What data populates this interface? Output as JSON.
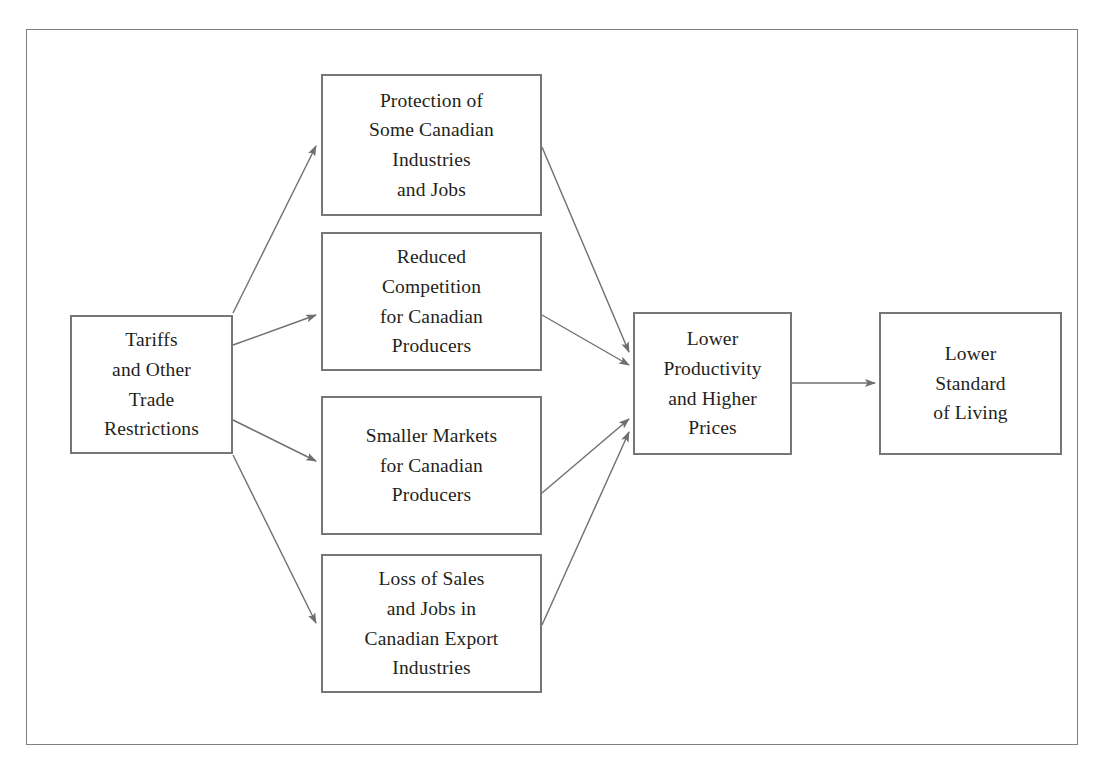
{
  "figure": {
    "frame_color": "#7e7e80",
    "box_border_color": "#76767a",
    "text_color": "#231f20",
    "arrow_color": "#6f6f73",
    "background": "#ffffff"
  },
  "nodes": [
    {
      "id": "tariffs",
      "name": "tariffs-and-other-trade-restrictions",
      "lines": [
        "Tariffs",
        "and Other",
        "Trade",
        "Restrictions"
      ]
    },
    {
      "id": "protection",
      "name": "protection-of-some-canadian-industries-and-jobs",
      "lines": [
        "Protection of",
        "Some Canadian",
        "Industries",
        "and Jobs"
      ]
    },
    {
      "id": "reduced",
      "name": "reduced-competition-for-canadian-producers",
      "lines": [
        "Reduced",
        "Competition",
        "for Canadian",
        "Producers"
      ]
    },
    {
      "id": "smaller",
      "name": "smaller-markets-for-canadian-producers",
      "lines": [
        "Smaller Markets",
        "for Canadian",
        "Producers"
      ]
    },
    {
      "id": "loss",
      "name": "loss-of-sales-and-jobs-in-canadian-export-industries",
      "lines": [
        "Loss of Sales",
        "and Jobs in",
        "Canadian Export",
        "Industries"
      ]
    },
    {
      "id": "productivity",
      "name": "lower-productivity-and-higher-prices",
      "lines": [
        "Lower",
        "Productivity",
        "and Higher",
        "Prices"
      ]
    },
    {
      "id": "standard",
      "name": "lower-standard-of-living",
      "lines": [
        "Lower",
        "Standard",
        "of Living"
      ]
    }
  ],
  "edges": [
    {
      "from": "tariffs",
      "to": "protection",
      "name": "arrow-tariffs-to-protection"
    },
    {
      "from": "tariffs",
      "to": "reduced",
      "name": "arrow-tariffs-to-reduced"
    },
    {
      "from": "tariffs",
      "to": "smaller",
      "name": "arrow-tariffs-to-smaller"
    },
    {
      "from": "tariffs",
      "to": "loss",
      "name": "arrow-tariffs-to-loss"
    },
    {
      "from": "protection",
      "to": "productivity",
      "name": "arrow-protection-to-productivity"
    },
    {
      "from": "reduced",
      "to": "productivity",
      "name": "arrow-reduced-to-productivity"
    },
    {
      "from": "smaller",
      "to": "productivity",
      "name": "arrow-smaller-to-productivity"
    },
    {
      "from": "loss",
      "to": "productivity",
      "name": "arrow-loss-to-productivity"
    },
    {
      "from": "productivity",
      "to": "standard",
      "name": "arrow-productivity-to-standard"
    }
  ]
}
